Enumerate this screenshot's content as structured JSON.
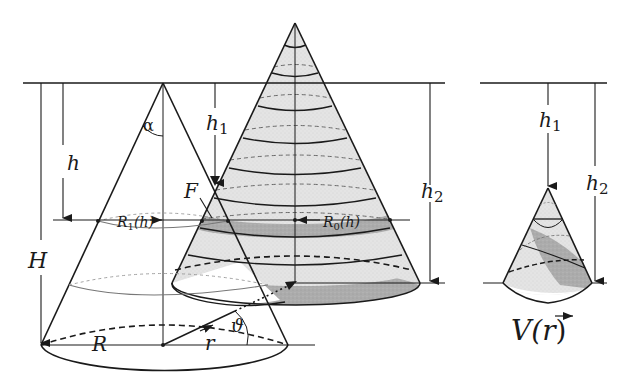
{
  "colors": {
    "line": "#1a1a1a",
    "shade_light": "#e3e3e3",
    "shade_dark": "#a9a9a9",
    "background": "#ffffff"
  },
  "labels": {
    "alpha": "α",
    "h": "h",
    "H": "H",
    "h1_left": "h",
    "h1_left_sub": "1",
    "h2_mid": "h",
    "h2_mid_sub": "2",
    "h1_right": "h",
    "h1_right_sub": "1",
    "h2_right": "h",
    "h2_right_sub": "2",
    "F": "F",
    "R1h": "R",
    "R1h_sub": "1",
    "R1h_arg": "(h)",
    "R0h": "R",
    "R0h_sub": "0",
    "R0h_arg": "(h)",
    "R": "R",
    "r_vec": "r",
    "theta": "ϑ",
    "V_r": "V(",
    "V_r_vec": "r",
    "V_r_close": ")"
  }
}
